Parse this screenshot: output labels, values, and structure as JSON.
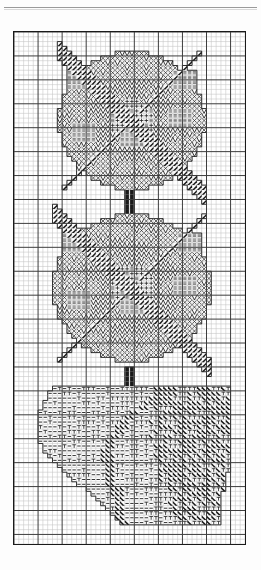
{
  "document": {
    "kind": "needlepoint-pattern-chart",
    "title": "Rose Motif Needlepoint Chart",
    "page_rule_visible": true
  },
  "chart_data": {
    "type": "heatmap",
    "subtitle": "Two rose blossoms above a leaf",
    "xlabel": "",
    "ylabel": "",
    "grid": true,
    "legend_position": "none",
    "axis_ranges": {
      "x": [
        0,
        48
      ],
      "y": [
        0,
        107
      ]
    },
    "cols": 48,
    "rows": 107,
    "major_every": 5,
    "cell_px": 4.85,
    "colors": {
      "paper": "#ffffff",
      "ink": "#1a1a1a",
      "minor_grid": "#b9b9b9",
      "major_grid": "#3b3b3b",
      "frame": "#1a1a1a",
      "rule": "#9a9a9a"
    },
    "symbol_key": [
      {
        "code": "bar",
        "name": "horizontal-bars",
        "glyph": "≡",
        "region": "petal-highlight"
      },
      {
        "code": "slash",
        "name": "heavy-diagonal",
        "glyph": "╱",
        "region": "petal-shadow"
      },
      {
        "code": "zig",
        "name": "zigzag-vee",
        "glyph": "∨",
        "region": "petal-mid"
      },
      {
        "code": "plus",
        "name": "plus-cross",
        "glyph": "+",
        "region": "blossom-core"
      },
      {
        "code": "x",
        "name": "crosshatch",
        "glyph": "×",
        "region": "blossom-outer"
      },
      {
        "code": "dash",
        "name": "short-dash",
        "glyph": "–",
        "region": "leaf-light"
      },
      {
        "code": "tee",
        "name": "tee-stitch",
        "glyph": "⊤",
        "region": "leaf-mid"
      },
      {
        "code": "bslash",
        "name": "back-diagonal",
        "glyph": "╲",
        "region": "leaf-dark"
      },
      {
        "code": "solid",
        "name": "solid-fill",
        "glyph": "■",
        "region": "stem"
      }
    ],
    "motifs": [
      {
        "name": "upper-blossom",
        "center_col": 24,
        "center_row": 18,
        "radius": 15
      },
      {
        "name": "upper-stem",
        "center_col": 24,
        "center_row": 34,
        "height": 4
      },
      {
        "name": "lower-blossom",
        "center_col": 24,
        "center_row": 53,
        "radius": 16
      },
      {
        "name": "lower-stem",
        "center_col": 24,
        "center_row": 71,
        "height": 4
      },
      {
        "name": "leaf",
        "top_row": 74,
        "bottom_row": 102,
        "left_col": 3,
        "right_col": 45
      }
    ],
    "region_counts": [
      {
        "region": "petal-highlight",
        "cells": 96
      },
      {
        "region": "petal-shadow",
        "cells": 140
      },
      {
        "region": "petal-mid",
        "cells": 268
      },
      {
        "region": "blossom-core",
        "cells": 74
      },
      {
        "region": "blossom-outer",
        "cells": 352
      },
      {
        "region": "leaf-light",
        "cells": 330
      },
      {
        "region": "leaf-mid",
        "cells": 286
      },
      {
        "region": "leaf-dark",
        "cells": 398
      },
      {
        "region": "stem",
        "cells": 22
      }
    ]
  }
}
